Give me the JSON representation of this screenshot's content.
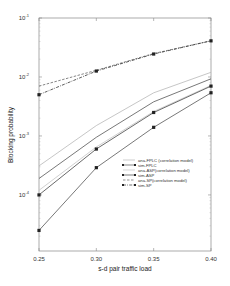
{
  "chart_data": {
    "type": "line",
    "title": "",
    "xlabel": "s-d pair traffic load",
    "ylabel": "Blocking probability",
    "x": [
      0.25,
      0.3,
      0.35,
      0.4
    ],
    "xlim": [
      0.25,
      0.4
    ],
    "ylim": [
      1.12e-05,
      0.1
    ],
    "yscale": "log",
    "xticks": [
      "0.25",
      "0.30",
      "0.35",
      "0.40"
    ],
    "yticks": [
      {
        "base": "10",
        "exp": "-1"
      },
      {
        "base": "10",
        "exp": "-2"
      },
      {
        "base": "10",
        "exp": "-3"
      },
      {
        "base": "10",
        "exp": "-4"
      }
    ],
    "ytick_values": [
      0.1,
      0.01,
      0.001,
      0.0001
    ],
    "legend_position": "lower-right",
    "series": [
      {
        "name": "ana-FPLC (correlation model)",
        "style": "solid",
        "color": "#b8b8b8",
        "marker": false,
        "values": [
          0.00031,
          0.0015,
          0.0054,
          0.012
        ]
      },
      {
        "name": "sim-FPLC",
        "style": "solid",
        "color": "#555555",
        "marker": true,
        "values": [
          2.5e-05,
          0.00029,
          0.0014,
          0.0054
        ]
      },
      {
        "name": "ana-ASP(correlation model)",
        "style": "solid",
        "color": "#c4c4c4",
        "marker": false,
        "values": [
          0.00012,
          0.00065,
          0.0026,
          0.0072
        ]
      },
      {
        "name": "sim-ASP",
        "style": "solid",
        "color": "#444444",
        "marker": true,
        "values": [
          0.0001,
          0.0006,
          0.0025,
          0.007
        ]
      },
      {
        "name": "ana-SP(correlation model)",
        "style": "dashed",
        "color": "#666666",
        "marker": false,
        "values": [
          0.007,
          0.013,
          0.025,
          0.041
        ]
      },
      {
        "name": "sim-SP",
        "style": "dashdot",
        "color": "#333333",
        "marker": true,
        "values": [
          0.005,
          0.0126,
          0.0245,
          0.041
        ]
      }
    ],
    "extra_unmarked_line": {
      "name": "ana (dark solid)",
      "color": "#555555",
      "values": [
        0.00019,
        0.00095,
        0.0038,
        0.0093
      ]
    },
    "grid": false
  }
}
